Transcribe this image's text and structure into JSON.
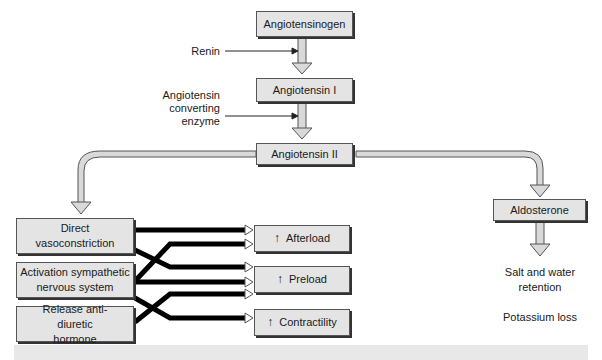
{
  "nodes": {
    "angiotensinogen": "Angiotensinogen",
    "angiotensin_1": "Angiotensin I",
    "angiotensin_2": "Angiotensin II",
    "aldosterone": "Aldosterone",
    "direct_vasoconstriction": "Direct vasoconstriction",
    "activation_sympathetic": "Activation sympathetic nervous system",
    "release_adh": "Release anti-diuretic hormone",
    "afterload": "Afterload",
    "preload": "Preload",
    "contractility": "Contractility"
  },
  "labels": {
    "renin": "Renin",
    "ace_line1": "Angiotensin",
    "ace_line2": "converting",
    "ace_line3": "enzyme",
    "salt_line1": "Salt and water",
    "salt_line2": "retention",
    "potassium": "Potassium loss"
  },
  "icons": {
    "increase": "↑"
  },
  "colors": {
    "box_fill": "#e4e4e4",
    "pipe_fill": "#d9d9d9",
    "wire": "#000000"
  }
}
